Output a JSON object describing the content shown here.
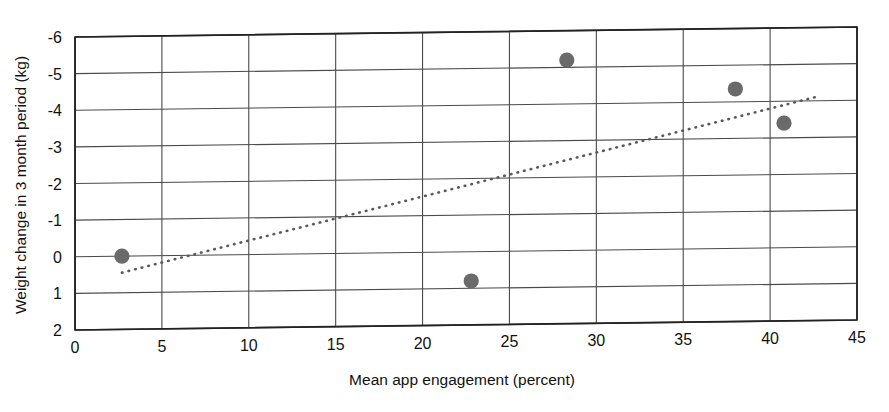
{
  "chart_data": {
    "type": "scatter",
    "title": "",
    "xlabel": "Mean app engagement (percent)",
    "ylabel": "Weight change in 3 month period (kg)",
    "xlim": [
      0,
      45
    ],
    "ylim": [
      2,
      -6
    ],
    "y_axis_inverted": true,
    "grid": true,
    "legend": "none",
    "xticks": [
      "0",
      "5",
      "10",
      "15",
      "20",
      "25",
      "30",
      "35",
      "40",
      "45"
    ],
    "xtick_values": [
      0,
      5,
      10,
      15,
      20,
      25,
      30,
      35,
      40,
      45
    ],
    "yticks": [
      "-6",
      "-5",
      "-4",
      "-3",
      "-2",
      "-1",
      "0",
      "1",
      "2"
    ],
    "ytick_values": [
      -6,
      -5,
      -4,
      -3,
      -2,
      -1,
      0,
      1,
      2
    ],
    "series": [
      {
        "name": "observations",
        "marker": "circle",
        "color": "#6a6a6a",
        "points": [
          {
            "x": 2.7,
            "y": 0.0
          },
          {
            "x": 22.8,
            "y": 0.8
          },
          {
            "x": 28.3,
            "y": -5.2
          },
          {
            "x": 38.0,
            "y": -4.35
          },
          {
            "x": 40.8,
            "y": -3.4
          }
        ]
      }
    ],
    "trendline": {
      "name": "fitted trend",
      "style": "dotted",
      "color": "#5a5a5a",
      "x_start": 2.7,
      "y_start": 0.45,
      "x_end": 42.6,
      "y_end": -4.1
    }
  },
  "colors": {
    "marker": "#6a6a6a",
    "grid": "#4a4a4a",
    "axis": "#222222",
    "trend": "#5a5a5a",
    "text": "#111111",
    "background": "#ffffff"
  }
}
